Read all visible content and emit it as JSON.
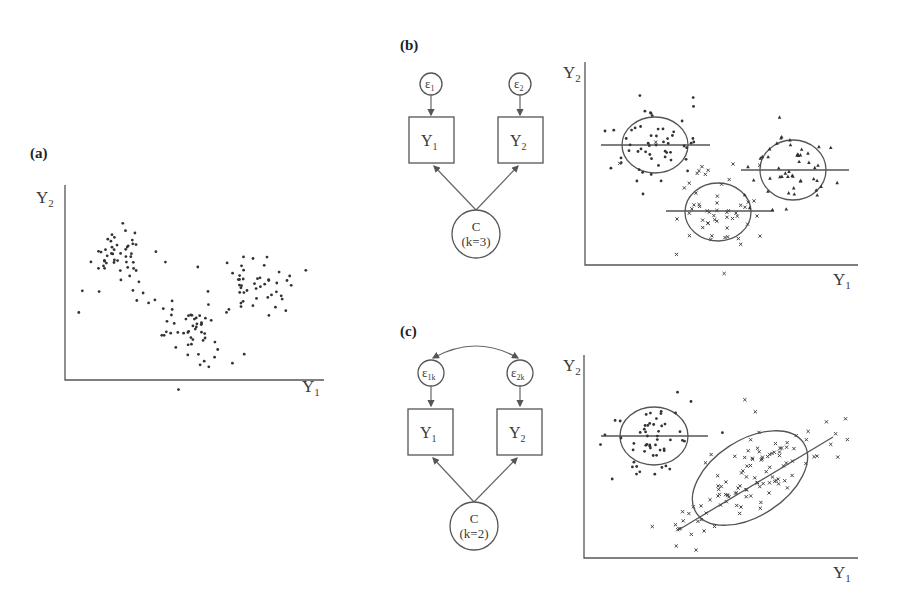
{
  "panels": {
    "a": {
      "label": "(a)",
      "y_axis": "Y",
      "y_sub": "2",
      "x_axis": "Y",
      "x_sub": "1"
    },
    "b": {
      "label": "(b)",
      "diagram": {
        "error1": "ε",
        "error1_sub": "1",
        "error2": "ε",
        "error2_sub": "2",
        "obs1": "Y",
        "obs1_sub": "1",
        "obs2": "Y",
        "obs2_sub": "2",
        "latent": "C",
        "latent_k": "(k=3)"
      },
      "plot": {
        "y_axis": "Y",
        "y_sub": "2",
        "x_axis": "Y",
        "x_sub": "1",
        "classes": [
          {
            "marker": "dot",
            "center": [
              655,
              145
            ]
          },
          {
            "marker": "x",
            "center": [
              718,
              212
            ]
          },
          {
            "marker": "triangle",
            "center": [
              793,
              170
            ]
          }
        ]
      }
    },
    "c": {
      "label": "(c)",
      "diagram": {
        "error1": "ε",
        "error1_sub": "1k",
        "error2": "ε",
        "error2_sub": "2k",
        "obs1": "Y",
        "obs1_sub": "1",
        "obs2": "Y",
        "obs2_sub": "2",
        "latent": "C",
        "latent_k": "(k=2)",
        "covariance": "curved double-headed arrow between error terms"
      },
      "plot": {
        "y_axis": "Y",
        "y_sub": "2",
        "x_axis": "Y",
        "x_sub": "1",
        "classes": [
          {
            "marker": "dot",
            "center": [
              653,
              436
            ]
          },
          {
            "marker": "x",
            "center": [
              750,
              478
            ],
            "correlated": true
          }
        ]
      }
    }
  },
  "colors": {
    "ink": "#333333",
    "lines": "#555555",
    "background": "#ffffff"
  }
}
